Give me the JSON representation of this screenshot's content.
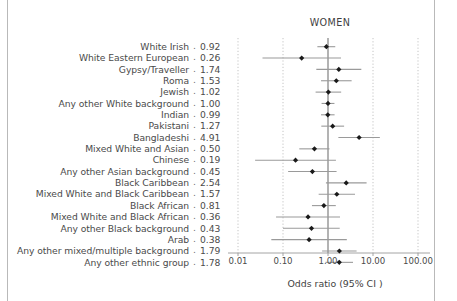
{
  "chart_data": {
    "type": "scatter",
    "title": "WOMEN",
    "xlabel": "Odds ratio (95% CI )",
    "ylabel": "",
    "xscale": "log",
    "xlim": [
      0.01,
      100.0
    ],
    "xticks": [
      0.01,
      0.1,
      1.0,
      10.0,
      100.0
    ],
    "xtick_labels": [
      "0.01",
      "0.10",
      "1.00",
      "10.00",
      "100.00"
    ],
    "reference_line": 1.0,
    "grid": "vertical dotted at ticks",
    "legend": "none",
    "value_column_header": "",
    "categories": [
      "White Irish",
      "White Eastern European",
      "Gypsy/Traveller",
      "Roma",
      "Jewish",
      "Any other White background",
      "Indian",
      "Pakistani",
      "Bangladeshi",
      "Mixed White and Asian",
      "Chinese",
      "Any other Asian background",
      "Black Caribbean",
      "Mixed White and Black Caribbean",
      "Black African",
      "Mixed White and Black African",
      "Any other Black background",
      "Arab",
      "Any other mixed/multiple background",
      "Any other ethnic group"
    ],
    "values": [
      0.92,
      0.26,
      1.74,
      1.53,
      1.02,
      1.0,
      0.99,
      1.27,
      4.91,
      0.5,
      0.19,
      0.45,
      2.54,
      1.57,
      0.81,
      0.36,
      0.43,
      0.38,
      1.79,
      1.78
    ],
    "ci_low": [
      0.58,
      0.035,
      0.55,
      0.7,
      0.53,
      0.72,
      0.7,
      0.71,
      1.7,
      0.23,
      0.024,
      0.13,
      0.9,
      0.62,
      0.44,
      0.07,
      0.1,
      0.055,
      0.74,
      0.88
    ],
    "ci_high": [
      1.45,
      1.95,
      5.5,
      3.35,
      1.96,
      1.39,
      1.4,
      2.28,
      14.2,
      1.08,
      1.5,
      1.55,
      7.2,
      3.98,
      1.49,
      1.85,
      1.82,
      2.62,
      4.32,
      3.6
    ],
    "marker": "filled-diamond",
    "marker_color": "#1a1a1a",
    "ci_color": "#9a9a9a",
    "reference_line_color": "#8a8a8a",
    "grid_color": "#bdbdbd"
  },
  "plot": {
    "title": "WOMEN",
    "axis_title": "Odds ratio (95% CI )"
  },
  "rows": [
    {
      "label": "White Irish",
      "sep": ".",
      "value": "0.92"
    },
    {
      "label": "White Eastern European",
      "sep": ".",
      "value": "0.26"
    },
    {
      "label": "Gypsy/Traveller",
      "sep": ".",
      "value": "1.74"
    },
    {
      "label": "Roma",
      "sep": ".",
      "value": "1.53"
    },
    {
      "label": "Jewish",
      "sep": ".",
      "value": "1.02"
    },
    {
      "label": "Any other White background",
      "sep": ".",
      "value": "1.00"
    },
    {
      "label": "Indian",
      "sep": ".",
      "value": "0.99"
    },
    {
      "label": "Pakistani",
      "sep": ".",
      "value": "1.27"
    },
    {
      "label": "Bangladeshi",
      "sep": ".",
      "value": "4.91"
    },
    {
      "label": "Mixed White and Asian",
      "sep": ".",
      "value": "0.50"
    },
    {
      "label": "Chinese",
      "sep": ".",
      "value": "0.19"
    },
    {
      "label": "Any other Asian background",
      "sep": ".",
      "value": "0.45"
    },
    {
      "label": "Black Caribbean",
      "sep": ".",
      "value": "2.54"
    },
    {
      "label": "Mixed White and Black Caribbean",
      "sep": ".",
      "value": "1.57"
    },
    {
      "label": "Black African",
      "sep": ".",
      "value": "0.81"
    },
    {
      "label": "Mixed White and Black African",
      "sep": ".",
      "value": "0.36"
    },
    {
      "label": "Any other Black background",
      "sep": ".",
      "value": "0.43"
    },
    {
      "label": "Arab",
      "sep": ".",
      "value": "0.38"
    },
    {
      "label": "Any other mixed/multiple background",
      "sep": ".",
      "value": "1.79"
    },
    {
      "label": "Any other ethnic group",
      "sep": ".",
      "value": "1.78"
    }
  ]
}
